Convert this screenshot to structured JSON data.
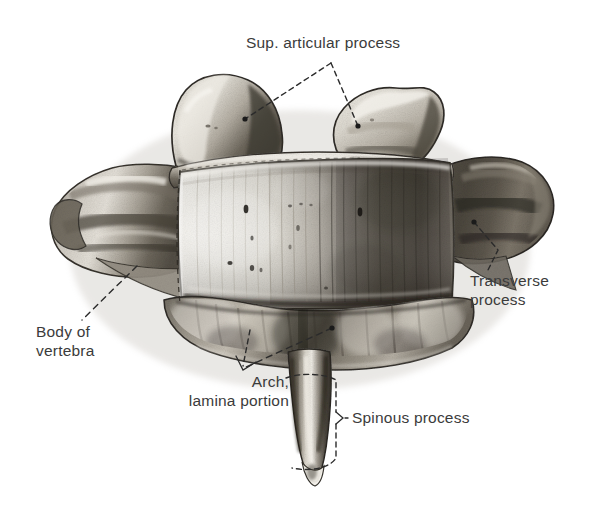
{
  "figure": {
    "subject": "vertebra",
    "view": "posterior-superior view of a thoracic vertebra",
    "style": "grayscale halftone anatomical illustration",
    "background_color": "#ffffff",
    "ink_color": "#3b3b3b",
    "leader_line_color": "#2b2b2b"
  },
  "labels": {
    "sup_articular_process": "Sup. articular process",
    "transverse_process_line1": "Transverse",
    "transverse_process_line2": "process",
    "body_of_vertebra_line1": "Body of",
    "body_of_vertebra_line2": "vertebra",
    "arch_line1": "Arch,",
    "arch_line2": "lamina portion",
    "spinous_process": "Spinous process"
  }
}
